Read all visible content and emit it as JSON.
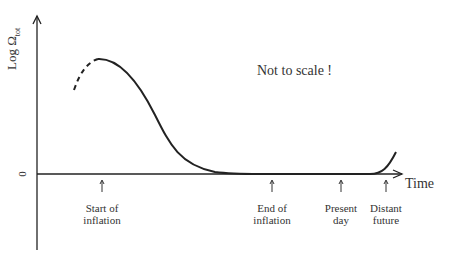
{
  "diagram": {
    "y_axis_label": "Log Ω",
    "y_axis_label_sub": "tot",
    "zero_label": "0",
    "x_axis_label": "Time",
    "note": "Not to scale !",
    "markers": [
      {
        "line1": "Start of",
        "line2": "inflation"
      },
      {
        "line1": "End of",
        "line2": "inflation"
      },
      {
        "line1": "Present",
        "line2": "day"
      },
      {
        "line1": "Distant",
        "line2": "future"
      }
    ],
    "colors": {
      "line": "#222222",
      "text": "#333333"
    }
  }
}
